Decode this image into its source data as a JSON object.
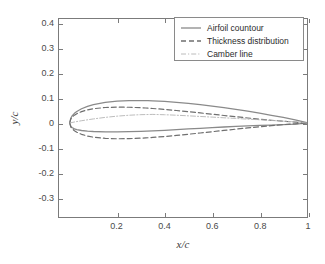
{
  "chart_data": {
    "type": "line",
    "title": "",
    "subtitle": "",
    "xlabel": "x/c",
    "ylabel": "y/c",
    "xlim": [
      -0.045,
      1.0
    ],
    "ylim": [
      -0.38,
      0.42
    ],
    "grid": false,
    "legend_position": "top-right",
    "xticks": [
      0.2,
      0.4,
      0.6,
      0.8,
      1
    ],
    "xtick_labels": [
      "0.2",
      "0.4",
      "0.6",
      "0.8",
      "1"
    ],
    "yticks": [
      0.4,
      0.3,
      0.2,
      0.1,
      0,
      -0.1,
      -0.2,
      -0.3
    ],
    "ytick_labels": [
      "0.4",
      "0.3",
      "0.2",
      "0.1",
      "0",
      "-0.1",
      "-0.2",
      "-0.3"
    ],
    "series": [
      {
        "name": "Airfoil countour",
        "style": "solid",
        "color": "#8a8a8a",
        "width": 1.3,
        "x": [
          0.0,
          0.005,
          0.01,
          0.02,
          0.03,
          0.05,
          0.075,
          0.1,
          0.15,
          0.2,
          0.25,
          0.3,
          0.33,
          0.35,
          0.4,
          0.45,
          0.5,
          0.55,
          0.6,
          0.65,
          0.7,
          0.75,
          0.8,
          0.85,
          0.9,
          0.95,
          1.0
        ],
        "y": [
          0.0,
          0.02,
          0.028,
          0.039,
          0.0465,
          0.0575,
          0.067,
          0.074,
          0.083,
          0.088,
          0.0898,
          0.09,
          0.0898,
          0.089,
          0.0868,
          0.0835,
          0.0792,
          0.0742,
          0.0684,
          0.062,
          0.055,
          0.0474,
          0.0394,
          0.031,
          0.0224,
          0.0128,
          0.001
        ],
        "x_lower": [
          0.0,
          0.005,
          0.01,
          0.02,
          0.03,
          0.05,
          0.075,
          0.1,
          0.15,
          0.2,
          0.25,
          0.3,
          0.35,
          0.4,
          0.45,
          0.5,
          0.55,
          0.6,
          0.65,
          0.7,
          0.75,
          0.8,
          0.85,
          0.9,
          0.95,
          1.0
        ],
        "y_lower": [
          0.0,
          -0.014,
          -0.0185,
          -0.0238,
          -0.027,
          -0.0305,
          -0.033,
          -0.0345,
          -0.0358,
          -0.036,
          -0.0353,
          -0.034,
          -0.032,
          -0.0296,
          -0.027,
          -0.0243,
          -0.0216,
          -0.0189,
          -0.0164,
          -0.0141,
          -0.012,
          -0.0101,
          -0.0085,
          -0.007,
          -0.005,
          -0.001
        ]
      },
      {
        "name": "Thickness distribution",
        "style": "dashed",
        "color": "#6f6f6f",
        "width": 1.2,
        "x": [
          0.0,
          0.005,
          0.01,
          0.02,
          0.03,
          0.05,
          0.075,
          0.1,
          0.15,
          0.2,
          0.25,
          0.3,
          0.32,
          0.35,
          0.4,
          0.45,
          0.5,
          0.55,
          0.6,
          0.65,
          0.7,
          0.75,
          0.8,
          0.85,
          0.9,
          0.95,
          1.0
        ],
        "y": [
          0.0,
          0.0165,
          0.0229,
          0.0315,
          0.0375,
          0.0459,
          0.053,
          0.0576,
          0.0624,
          0.064,
          0.0634,
          0.0615,
          0.0604,
          0.0585,
          0.0547,
          0.0503,
          0.0456,
          0.0406,
          0.0354,
          0.0302,
          0.0251,
          0.0201,
          0.0154,
          0.0109,
          0.0069,
          0.0034,
          0.0
        ],
        "y_mirror": [
          0.0,
          -0.0165,
          -0.0229,
          -0.0315,
          -0.0375,
          -0.0459,
          -0.053,
          -0.0576,
          -0.0624,
          -0.064,
          -0.0634,
          -0.0615,
          -0.0604,
          -0.0585,
          -0.0547,
          -0.0503,
          -0.0456,
          -0.0406,
          -0.0354,
          -0.0302,
          -0.0251,
          -0.0201,
          -0.0154,
          -0.0109,
          -0.0069,
          -0.0034,
          0.0
        ]
      },
      {
        "name": "Camber line",
        "style": "dash-dot",
        "color": "#b4b4b4",
        "width": 0.9,
        "x": [
          0.0,
          0.025,
          0.05,
          0.1,
          0.15,
          0.2,
          0.25,
          0.3,
          0.35,
          0.4,
          0.42,
          0.45,
          0.5,
          0.55,
          0.6,
          0.65,
          0.7,
          0.75,
          0.8,
          0.85,
          0.9,
          0.95,
          1.0
        ],
        "y": [
          0.0,
          0.0048,
          0.009,
          0.0163,
          0.0225,
          0.0275,
          0.0312,
          0.0335,
          0.0345,
          0.0332,
          0.0325,
          0.0312,
          0.0288,
          0.0262,
          0.0236,
          0.0209,
          0.0182,
          0.0155,
          0.0128,
          0.0101,
          0.0073,
          0.0046,
          0.0
        ]
      }
    ]
  },
  "axes": {
    "x_title": "x/c",
    "y_title": "y/c"
  },
  "legend": {
    "entries": [
      {
        "label": "Airfoil countour",
        "style": "solid",
        "color": "#8a8a8a"
      },
      {
        "label": "Thickness distribution",
        "style": "dashed",
        "color": "#6f6f6f"
      },
      {
        "label": "Camber line",
        "style": "dash-dot",
        "color": "#b4b4b4"
      }
    ]
  },
  "colors": {
    "axis": "#7b7b7b",
    "tick_text": "#4a4a4a",
    "background": "#ffffff",
    "legend_border": "#8a8a8a"
  }
}
